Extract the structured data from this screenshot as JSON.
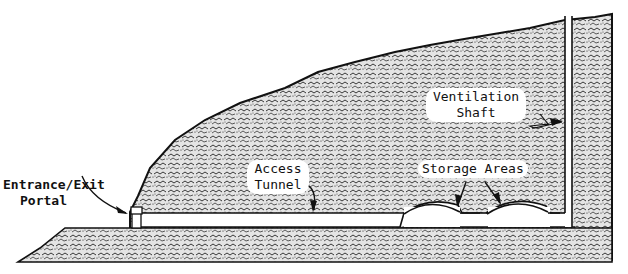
{
  "diagram": {
    "type": "cross-section",
    "labels": {
      "entrance_line1": "Entrance/Exit",
      "entrance_line2": "Portal",
      "access_line1": "Access",
      "access_line2": "Tunnel",
      "storage": "Storage Areas",
      "vent_line1": "Ventilation",
      "vent_line2": "Shaft"
    },
    "colors": {
      "ink": "#111111",
      "rock_fill": "#d9d9d9",
      "background": "#ffffff"
    }
  }
}
